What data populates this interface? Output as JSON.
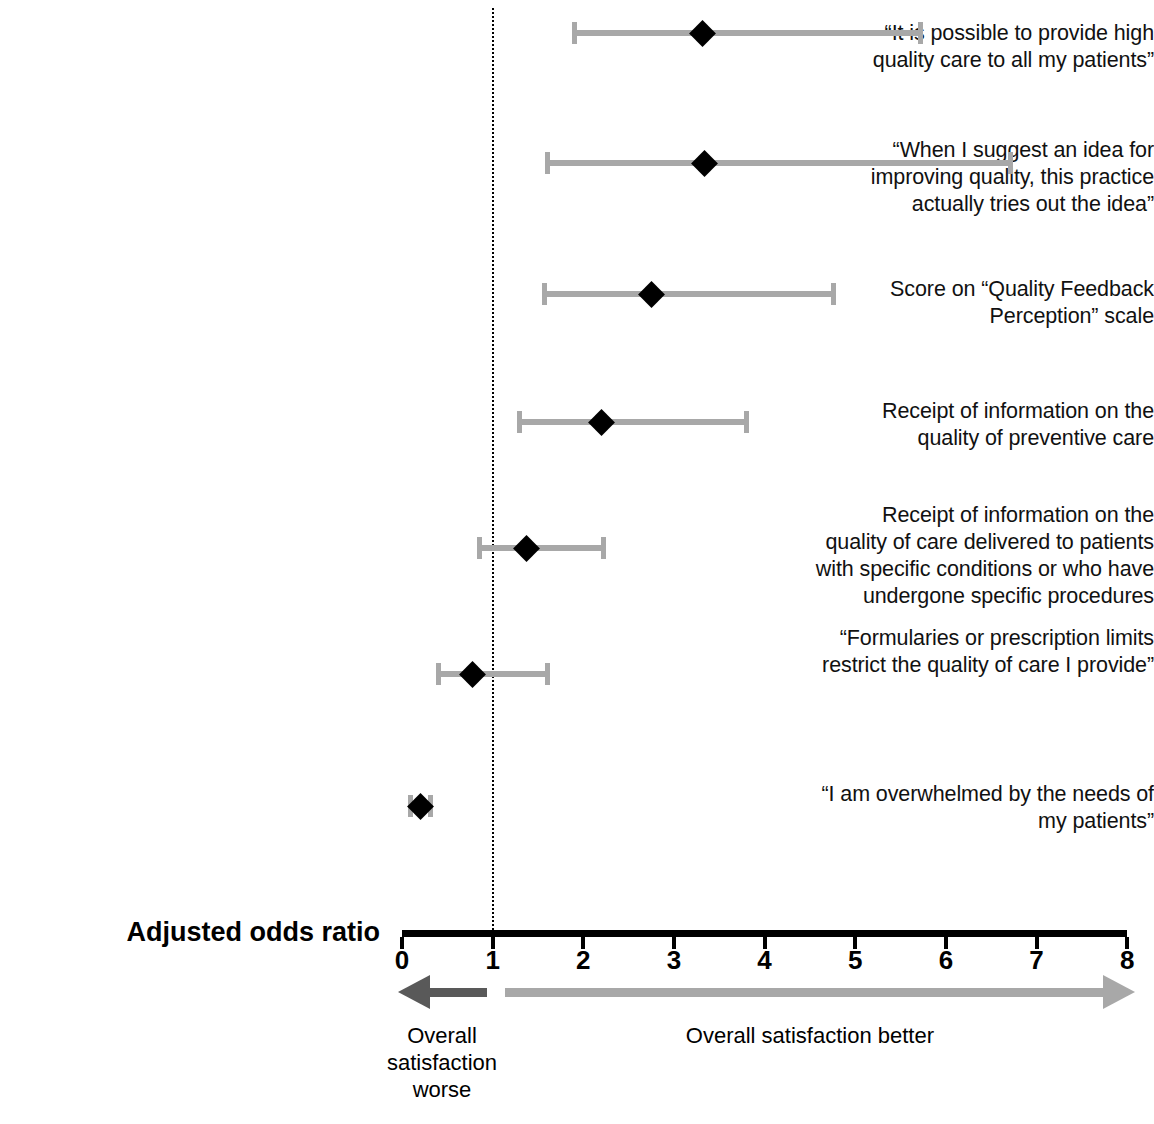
{
  "chart_data": {
    "type": "scatter",
    "subtype": "forest-plot",
    "title": "",
    "xlabel": "Adjusted odds ratio",
    "ylabel": "",
    "xlim": [
      0,
      8
    ],
    "xticks": [
      0,
      1,
      2,
      3,
      4,
      5,
      6,
      7,
      8
    ],
    "xtick_labels": [
      "0",
      "1",
      "2",
      "3",
      "4",
      "5",
      "6",
      "7",
      "8"
    ],
    "reference_line": 1,
    "grid": false,
    "legend": "none",
    "categories": [
      "“It is possible to provide high quality care to all my patients”",
      "“When I suggest an idea for improving quality, this practice actually tries out the idea”",
      "Score on “Quality Feedback Perception” scale",
      "Receipt of information on the quality of preventive care",
      "Receipt of information on the quality of care delivered to patients with specific conditions or who have undergone specific procedures",
      "“Formularies or prescription limits restrict the quality of care I provide”",
      "“I am overwhelmed by the needs of my patients”"
    ],
    "values": [
      3.32,
      3.34,
      2.75,
      2.2,
      1.37,
      0.78,
      0.2
    ],
    "ci_low": [
      1.87,
      1.58,
      1.54,
      1.27,
      0.83,
      0.38,
      0.07
    ],
    "ci_high": [
      5.75,
      6.74,
      4.79,
      3.83,
      2.25,
      1.63,
      0.34
    ],
    "colors": {
      "point": "#000000",
      "interval": "#a8a8a8",
      "axis": "#000000",
      "reference": "#000000",
      "arrow_worse": "#595959",
      "arrow_better": "#a8a8a8"
    }
  },
  "rows": [
    {
      "label_lines": [
        "“It is possible to provide high",
        "quality care to all my patients”"
      ],
      "estimate": 3.32,
      "low": 1.87,
      "high": 5.75
    },
    {
      "label_lines": [
        "“When I suggest an idea for",
        "improving quality, this practice",
        "actually tries out the idea”"
      ],
      "estimate": 3.34,
      "low": 1.58,
      "high": 6.74
    },
    {
      "label_lines": [
        "Score on “Quality Feedback",
        "Perception” scale"
      ],
      "estimate": 2.75,
      "low": 1.54,
      "high": 4.79
    },
    {
      "label_lines": [
        "Receipt of information on the",
        "quality of preventive care"
      ],
      "estimate": 2.2,
      "low": 1.27,
      "high": 3.83
    },
    {
      "label_lines": [
        "Receipt of information on the",
        "quality of care delivered to patients",
        "with specific conditions or who have",
        "undergone specific procedures"
      ],
      "estimate": 1.37,
      "low": 0.83,
      "high": 2.25
    },
    {
      "label_lines": [
        "“Formularies or prescription limits",
        "restrict the quality of care I provide”"
      ],
      "estimate": 0.78,
      "low": 0.38,
      "high": 1.63
    },
    {
      "label_lines": [
        "“I am overwhelmed by the needs of",
        "my patients”"
      ],
      "estimate": 0.2,
      "low": 0.07,
      "high": 0.34
    }
  ],
  "axis": {
    "title": "Adjusted odds ratio",
    "tick_labels": [
      "0",
      "1",
      "2",
      "3",
      "4",
      "5",
      "6",
      "7",
      "8"
    ]
  },
  "direction": {
    "worse_lines": [
      "Overall",
      "satisfaction",
      "worse"
    ],
    "better_label": "Overall satisfaction better"
  }
}
